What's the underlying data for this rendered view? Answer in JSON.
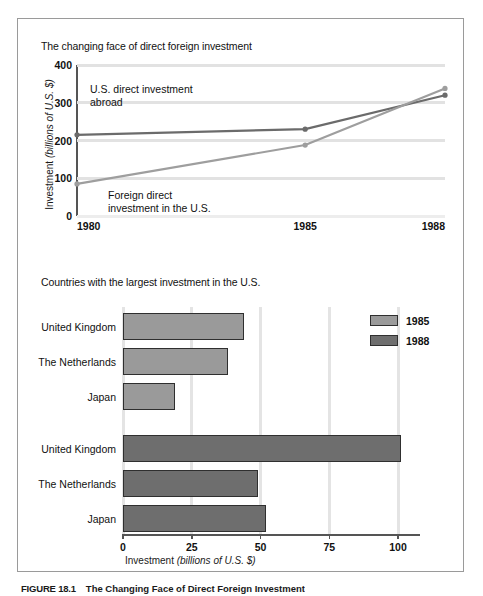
{
  "figure": {
    "caption_number": "FIGURE 18.1",
    "caption_text": "The Changing Face of Direct Foreign Investment"
  },
  "colors": {
    "series_1985": "#9a9a9a",
    "series_1988": "#6e6e6e",
    "line_us_abroad": "#6b6b6b",
    "line_foreign_in_us": "#9e9e9e",
    "gridline": "#e2e2e2",
    "axis": "#555555",
    "frame_border": "#9a9a9a"
  },
  "line_panel": {
    "title": "The changing face of direct foreign investment",
    "ylabel_plain": "Investment ",
    "ylabel_italic": "(billions of U.S. $)",
    "annotation_us": "U.S. direct investment abroad",
    "annotation_foreign": "Foreign direct investment in the U.S."
  },
  "bar_panel": {
    "title": "Countries with the largest investment in the U.S.",
    "xlabel_plain": "Investment ",
    "xlabel_italic": "(billions of U.S. $)"
  },
  "chart_data": [
    {
      "type": "line",
      "title": "The changing face of direct foreign investment",
      "xlabel": "",
      "ylabel": "Investment (billions of U.S. $)",
      "x": [
        "1980",
        "1985",
        "1988"
      ],
      "x_positions_pct": [
        0,
        62,
        100
      ],
      "ylim": [
        0,
        400
      ],
      "yticks": [
        0,
        100,
        200,
        300,
        400
      ],
      "grid": true,
      "legend": "inline-annotations",
      "series": [
        {
          "name": "U.S. direct investment abroad",
          "color": "#6b6b6b",
          "values": [
            215,
            230,
            320
          ]
        },
        {
          "name": "Foreign direct investment in the U.S.",
          "color": "#9e9e9e",
          "values": [
            85,
            188,
            338
          ]
        }
      ]
    },
    {
      "type": "bar",
      "orientation": "horizontal",
      "title": "Countries with the largest investment in the U.S.",
      "xlabel": "Investment (billions of U.S. $)",
      "ylabel": "",
      "xlim": [
        0,
        108
      ],
      "xticks": [
        0,
        25,
        50,
        75,
        100
      ],
      "grid": true,
      "legend_position": "top-right",
      "categories": [
        "United Kingdom",
        "The Netherlands",
        "Japan"
      ],
      "series": [
        {
          "name": "1985",
          "color": "#9a9a9a",
          "values": [
            44,
            38,
            19
          ]
        },
        {
          "name": "1988",
          "color": "#6e6e6e",
          "values": [
            101,
            49,
            52
          ]
        }
      ]
    }
  ]
}
